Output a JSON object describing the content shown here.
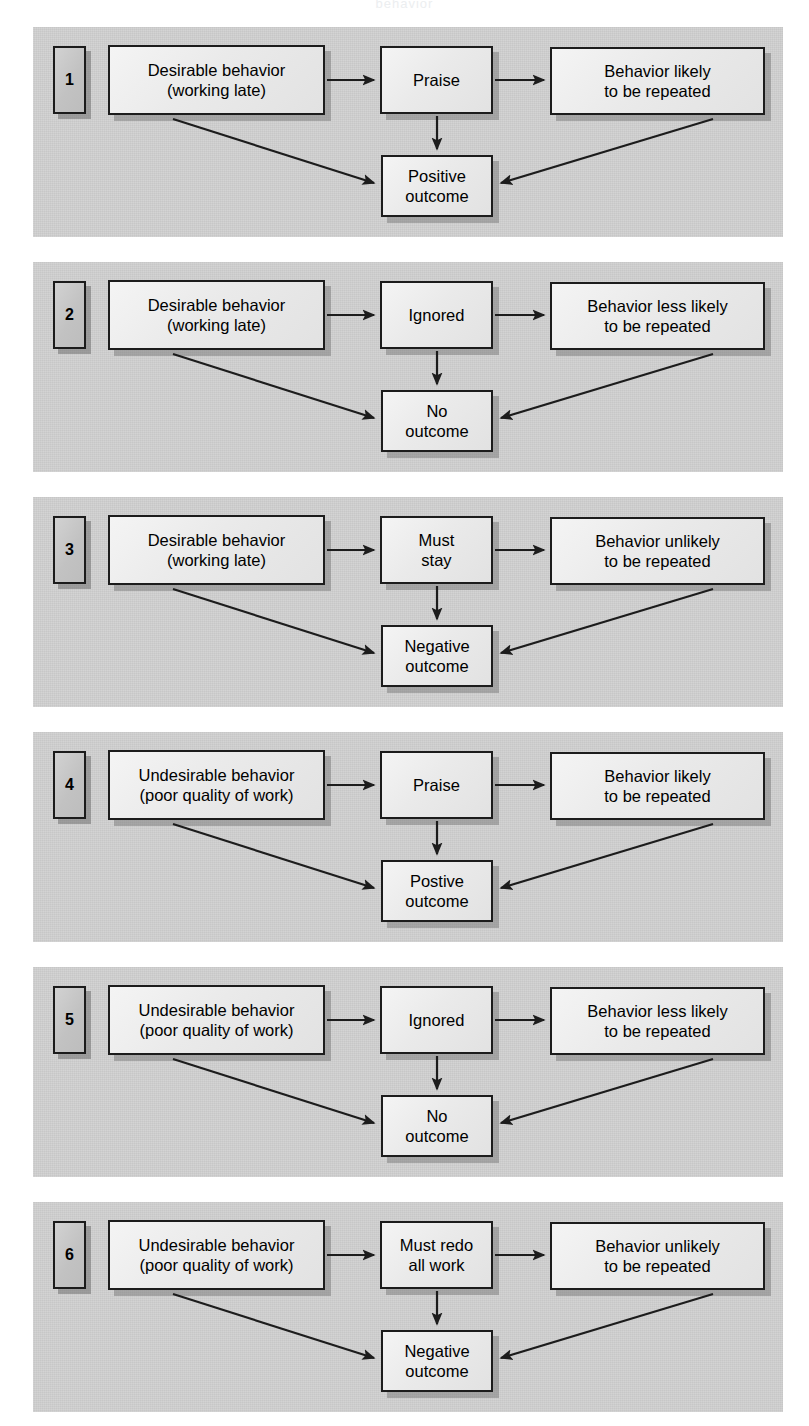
{
  "figure": {
    "title_partial": "behavior",
    "panel_count": 6,
    "colors": {
      "panel_background": "#cfcfcf",
      "box_fill": "#ededed",
      "box_border": "#1c1c1c",
      "shadow": "#6d6d6d",
      "text": "#000000",
      "page_background": "#ffffff"
    }
  },
  "panels": [
    {
      "number": "1",
      "behavior": {
        "line1": "Desirable behavior",
        "line2": "(working late)"
      },
      "consequence": {
        "line1": "Praise",
        "line2": ""
      },
      "likelihood": {
        "line1": "Behavior likely",
        "line2": "to be repeated"
      },
      "outcome": {
        "line1": "Positive",
        "line2": "outcome"
      }
    },
    {
      "number": "2",
      "behavior": {
        "line1": "Desirable behavior",
        "line2": "(working late)"
      },
      "consequence": {
        "line1": "Ignored",
        "line2": ""
      },
      "likelihood": {
        "line1": "Behavior less likely",
        "line2": "to be repeated"
      },
      "outcome": {
        "line1": "No",
        "line2": "outcome"
      }
    },
    {
      "number": "3",
      "behavior": {
        "line1": "Desirable behavior",
        "line2": "(working late)"
      },
      "consequence": {
        "line1": "Must",
        "line2": "stay"
      },
      "likelihood": {
        "line1": "Behavior unlikely",
        "line2": "to be repeated"
      },
      "outcome": {
        "line1": "Negative",
        "line2": "outcome"
      }
    },
    {
      "number": "4",
      "behavior": {
        "line1": "Undesirable behavior",
        "line2": "(poor quality of work)"
      },
      "consequence": {
        "line1": "Praise",
        "line2": ""
      },
      "likelihood": {
        "line1": "Behavior likely",
        "line2": "to be repeated"
      },
      "outcome": {
        "line1": "Postive",
        "line2": "outcome"
      }
    },
    {
      "number": "5",
      "behavior": {
        "line1": "Undesirable behavior",
        "line2": "(poor quality of work)"
      },
      "consequence": {
        "line1": "Ignored",
        "line2": ""
      },
      "likelihood": {
        "line1": "Behavior less likely",
        "line2": "to be repeated"
      },
      "outcome": {
        "line1": "No",
        "line2": "outcome"
      }
    },
    {
      "number": "6",
      "behavior": {
        "line1": "Undesirable behavior",
        "line2": "(poor quality of work)"
      },
      "consequence": {
        "line1": "Must redo",
        "line2": "all work"
      },
      "likelihood": {
        "line1": "Behavior unlikely",
        "line2": "to be repeated"
      },
      "outcome": {
        "line1": "Negative",
        "line2": "outcome"
      }
    }
  ]
}
